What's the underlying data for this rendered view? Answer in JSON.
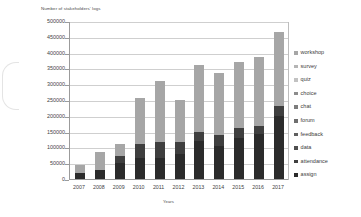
{
  "chart_data": {
    "type": "bar",
    "stacked": true,
    "title": "Number of stakeholders' logs",
    "xlabel": "Years",
    "ylabel": "Number of stakeholders' logs",
    "ylim": [
      0,
      500000
    ],
    "ytick_step": 50000,
    "grid": true,
    "legend_position": "right",
    "categories": [
      "2007",
      "2008",
      "2009",
      "2010",
      "2011",
      "2012",
      "2013",
      "2014",
      "2015",
      "2016",
      "2017"
    ],
    "yticks": [
      "500000",
      "450000",
      "400000",
      "350000",
      "300000",
      "250000",
      "200000",
      "150000",
      "100000",
      "50000",
      "0"
    ],
    "series": [
      {
        "name": "assign",
        "color": "#2b2b2b",
        "values": [
          18000,
          30000,
          50000,
          68000,
          68000,
          78000,
          120000,
          105000,
          130000,
          143000,
          200000
        ]
      },
      {
        "name": "attendance",
        "color": "#565656",
        "values": [
          0,
          0,
          0,
          0,
          0,
          0,
          0,
          0,
          0,
          0,
          0
        ]
      },
      {
        "name": "data",
        "color": "#3f3f3f",
        "values": [
          0,
          0,
          22000,
          44000,
          50000,
          38000,
          30000,
          33000,
          30000,
          26000,
          32000
        ]
      },
      {
        "name": "feedback",
        "color": "#6e6e6e",
        "values": [
          0,
          0,
          0,
          0,
          0,
          0,
          0,
          0,
          0,
          0,
          0
        ]
      },
      {
        "name": "forum",
        "color": "#7d7d7d",
        "values": [
          0,
          0,
          0,
          0,
          0,
          0,
          0,
          0,
          0,
          0,
          0
        ]
      },
      {
        "name": "chat",
        "color": "#8c8c8c",
        "values": [
          0,
          0,
          0,
          0,
          0,
          0,
          0,
          0,
          0,
          0,
          0
        ]
      },
      {
        "name": "choice",
        "color": "#9a9a9a",
        "values": [
          0,
          0,
          0,
          0,
          0,
          0,
          0,
          0,
          0,
          0,
          0
        ]
      },
      {
        "name": "quiz",
        "color": "#a8a8a8",
        "values": [
          0,
          0,
          0,
          0,
          0,
          0,
          0,
          0,
          0,
          0,
          0
        ]
      },
      {
        "name": "survey",
        "color": "#b5b5b5",
        "values": [
          0,
          0,
          0,
          0,
          0,
          0,
          0,
          0,
          0,
          0,
          0
        ]
      },
      {
        "name": "workshop",
        "color": "#a6a6a6",
        "values": [
          27000,
          55000,
          38000,
          143000,
          192000,
          134000,
          210000,
          197000,
          210000,
          216000,
          233000
        ]
      }
    ],
    "totals": [
      45000,
      85000,
      110000,
      255000,
      310000,
      250000,
      360000,
      335000,
      370000,
      385000,
      465000
    ]
  },
  "legend": {
    "items": [
      {
        "label": "workshop",
        "color": "#a6a6a6"
      },
      {
        "label": "survey",
        "color": "#b5b5b5"
      },
      {
        "label": "quiz",
        "color": "#c2c2c2"
      },
      {
        "label": "choice",
        "color": "#8c8c8c"
      },
      {
        "label": "chat",
        "color": "#7d7d7d"
      },
      {
        "label": "forum",
        "color": "#6e6e6e"
      },
      {
        "label": "feedback",
        "color": "#5f5f5f"
      },
      {
        "label": "data",
        "color": "#4f4f4f"
      },
      {
        "label": "attendance",
        "color": "#3f3f3f"
      },
      {
        "label": "assign",
        "color": "#2b2b2b"
      }
    ]
  }
}
